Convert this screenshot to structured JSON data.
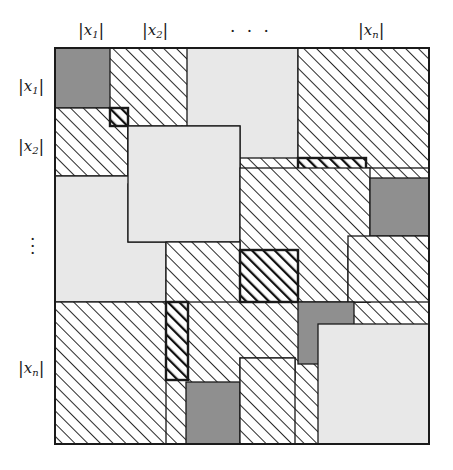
{
  "figure": {
    "kind": "block-matrix-sparsity-diagram",
    "background_color": "#ffffff",
    "line_color": "#1a1a1a"
  },
  "column_labels": [
    {
      "text_x": "x",
      "sub": "1",
      "left": 78,
      "top": 20,
      "name": "col-label-x1"
    },
    {
      "text_x": "x",
      "sub": "2",
      "left": 142,
      "top": 20,
      "name": "col-label-x2"
    },
    {
      "text_x": "x",
      "sub": "n",
      "left": 358,
      "top": 20,
      "name": "col-label-xn"
    }
  ],
  "column_ellipsis": {
    "glyph": "· · ·",
    "left": 230,
    "top": 22
  },
  "row_labels": [
    {
      "text_x": "x",
      "sub": "1",
      "left": 18,
      "top": 76,
      "name": "row-label-x1"
    },
    {
      "text_x": "x",
      "sub": "2",
      "left": 18,
      "top": 136,
      "name": "row-label-x2"
    },
    {
      "text_x": "x",
      "sub": "n",
      "left": 18,
      "top": 360,
      "name": "row-label-xn"
    }
  ],
  "row_ellipsis": {
    "glyph": "·\n·\n·",
    "left": 30,
    "top": 240
  },
  "matrix": {
    "x": 55,
    "y": 48,
    "width": 374,
    "height": 396,
    "border_color": "#1a1a1a",
    "border_width": 2,
    "fills": {
      "dark_gray": "#8f8f8f",
      "light_gray": "#e8e8e8",
      "white": "#ffffff",
      "hatch_light": "hatch-light",
      "hatch_dark": "hatch-dark",
      "cross_hatch": "cross-hatch"
    }
  },
  "blocks": [
    {
      "id": 1,
      "fill": "hatch_light",
      "x": 55,
      "y": 48,
      "w": 374,
      "h": 396,
      "stroke": "thin",
      "name": "block-background-hatch"
    },
    {
      "id": 2,
      "fill": "dark_gray",
      "x": 55,
      "y": 48,
      "w": 55,
      "h": 60,
      "stroke": "thin",
      "name": "block-r1c1-dark"
    },
    {
      "id": 3,
      "fill": "light_gray",
      "x": 187,
      "y": 48,
      "w": 111,
      "h": 110,
      "stroke": "thin",
      "name": "block-r1c3-light"
    },
    {
      "id": 4,
      "fill": "hatch_light",
      "x": 298,
      "y": 48,
      "w": 131,
      "h": 120,
      "stroke": "thin",
      "name": "block-r1c4-hatch"
    },
    {
      "id": 5,
      "fill": "hatch_light",
      "x": 55,
      "y": 108,
      "w": 73,
      "h": 68,
      "stroke": "thin",
      "name": "block-r2c1-hatch"
    },
    {
      "id": 6,
      "fill": "hatch_dark",
      "x": 110,
      "y": 108,
      "w": 18,
      "h": 18,
      "stroke": "thick",
      "name": "block-r2c2-small-dark-hatch"
    },
    {
      "id": 7,
      "fill": "light_gray",
      "x": 128,
      "y": 126,
      "w": 54,
      "h": 58,
      "stroke": "thin",
      "name": "block-r2c2-light"
    },
    {
      "id": 8,
      "fill": "dark_gray",
      "x": 182,
      "y": 126,
      "w": 58,
      "h": 42,
      "stroke": "thin",
      "name": "block-r2c3-dark"
    },
    {
      "id": 9,
      "fill": "hatch_dark",
      "x": 298,
      "y": 158,
      "w": 68,
      "h": 20,
      "stroke": "thick",
      "name": "block-r2c4-dark-hatch-strip"
    },
    {
      "id": 10,
      "fill": "light_gray",
      "x": 55,
      "y": 176,
      "w": 111,
      "h": 126,
      "stroke": "thin",
      "name": "block-r3c1-light"
    },
    {
      "id": 11,
      "fill": "dark_gray",
      "x": 128,
      "y": 184,
      "w": 40,
      "h": 58,
      "stroke": "thin",
      "name": "block-r3c2-dark"
    },
    {
      "id": 12,
      "fill": "light_gray",
      "x": 128,
      "y": 126,
      "w": 112,
      "h": 116,
      "stroke": "thin",
      "name": "block-r3c2-light-large"
    },
    {
      "id": 13,
      "fill": "hatch_light",
      "x": 240,
      "y": 168,
      "w": 130,
      "h": 134,
      "stroke": "thin",
      "name": "block-r3c3-hatch"
    },
    {
      "id": 14,
      "fill": "dark_gray",
      "x": 370,
      "y": 178,
      "w": 59,
      "h": 58,
      "stroke": "thin",
      "name": "block-r3c4-dark"
    },
    {
      "id": 15,
      "fill": "hatch_light",
      "x": 166,
      "y": 242,
      "w": 74,
      "h": 60,
      "stroke": "thin",
      "name": "block-r4c2-hatch"
    },
    {
      "id": 16,
      "fill": "hatch_dark",
      "x": 240,
      "y": 250,
      "w": 58,
      "h": 52,
      "stroke": "thick",
      "name": "block-r4c3-dark-hatch"
    },
    {
      "id": 17,
      "fill": "cross_hatch",
      "x": 348,
      "y": 246,
      "w": 22,
      "h": 56,
      "stroke": "thin",
      "name": "block-r4c4-cross-hatch-strip"
    },
    {
      "id": 18,
      "fill": "hatch_light",
      "x": 348,
      "y": 236,
      "w": 81,
      "h": 66,
      "stroke": "thin",
      "name": "block-r4c4-hatch"
    },
    {
      "id": 19,
      "fill": "hatch_light",
      "x": 55,
      "y": 302,
      "w": 111,
      "h": 142,
      "stroke": "thin",
      "name": "block-r5c1-hatch"
    },
    {
      "id": 20,
      "fill": "hatch_dark",
      "x": 166,
      "y": 302,
      "w": 22,
      "h": 78,
      "stroke": "thick",
      "name": "block-r5c2-dark-hatch-strip"
    },
    {
      "id": 21,
      "fill": "dark_gray",
      "x": 186,
      "y": 382,
      "w": 54,
      "h": 62,
      "stroke": "thin",
      "name": "block-r6c2-dark"
    },
    {
      "id": 22,
      "fill": "cross_hatch",
      "x": 240,
      "y": 358,
      "w": 55,
      "h": 22,
      "stroke": "thin",
      "name": "block-r5c3-cross-hatch-strip"
    },
    {
      "id": 23,
      "fill": "hatch_light",
      "x": 240,
      "y": 358,
      "w": 55,
      "h": 86,
      "stroke": "thin",
      "name": "block-r6c3-hatch"
    },
    {
      "id": 24,
      "fill": "dark_gray",
      "x": 298,
      "y": 302,
      "w": 56,
      "h": 62,
      "stroke": "thin",
      "name": "block-r5c4-dark"
    },
    {
      "id": 25,
      "fill": "light_gray",
      "x": 318,
      "y": 324,
      "w": 111,
      "h": 120,
      "stroke": "thin",
      "name": "block-r6c4-light"
    }
  ]
}
